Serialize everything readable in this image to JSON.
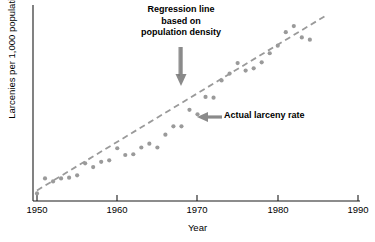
{
  "chart_data": {
    "type": "scatter",
    "title": "",
    "xlabel": "Year",
    "ylabel": "Larcenies per 1,000 population",
    "xlim": [
      1950,
      1990
    ],
    "ylim": [
      0,
      26
    ],
    "grid": false,
    "legend": "none",
    "x_ticks": [
      "1950",
      "1960",
      "1970",
      "1980",
      "1990"
    ],
    "x_tick_values": [
      1950,
      1960,
      1970,
      1980,
      1990
    ],
    "y_ticks": [],
    "series": [
      {
        "name": "Actual larceny rate",
        "type": "scatter",
        "color": "#9a9a9a",
        "x": [
          1950,
          1951,
          1952,
          1953,
          1954,
          1955,
          1956,
          1957,
          1958,
          1959,
          1960,
          1961,
          1962,
          1963,
          1964,
          1965,
          1966,
          1967,
          1968,
          1969,
          1970,
          1971,
          1972,
          1973,
          1974,
          1975,
          1976,
          1977,
          1978,
          1979,
          1980,
          1981,
          1982,
          1983,
          1984
        ],
        "values": [
          1.0,
          3.0,
          2.6,
          3.0,
          3.1,
          3.4,
          5.0,
          4.5,
          5.2,
          5.4,
          7.0,
          6.1,
          6.2,
          7.1,
          7.6,
          7.1,
          8.8,
          9.9,
          9.9,
          12.1,
          11.5,
          13.8,
          13.7,
          16.0,
          16.9,
          18.3,
          17.3,
          17.6,
          18.4,
          19.6,
          20.6,
          22.4,
          23.2,
          21.7,
          21.4
        ]
      },
      {
        "name": "Regression line based on population density",
        "type": "line",
        "style": "dashed",
        "color": "#9a9a9a",
        "x": [
          1950,
          1986
        ],
        "values": [
          1.4,
          24.6
        ]
      }
    ],
    "annotations": [
      {
        "name": "regression-line-annotation",
        "lines": [
          "Regression line",
          "based on",
          "population density"
        ],
        "arrow": "down",
        "target_x": 1968,
        "target_y": 16.0
      },
      {
        "name": "actual-rate-annotation",
        "lines": [
          "Actual larceny rate"
        ],
        "arrow": "left",
        "target_x": 1969,
        "target_y": 11.5
      }
    ]
  },
  "axes": {
    "x_label": "Year",
    "y_label": "Larcenies per 1,000 population",
    "ticks": [
      {
        "label": "1950"
      },
      {
        "label": "1960"
      },
      {
        "label": "1970"
      },
      {
        "label": "1980"
      },
      {
        "label": "1990"
      }
    ]
  },
  "annotations": {
    "regression": {
      "line1": "Regression line",
      "line2": "based on",
      "line3": "population density"
    },
    "actual": {
      "label": "Actual larceny rate"
    }
  },
  "caption": {
    "text": ""
  },
  "colors": {
    "axis": "#1a1a1a",
    "data_point": "#9a9a9a",
    "regression_line": "#9a9a9a",
    "annotation_text": "#000000",
    "arrow": "#8a8a8a",
    "background": "#ffffff"
  }
}
